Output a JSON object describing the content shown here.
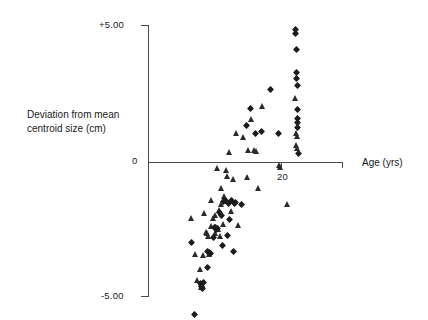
{
  "chart_data": {
    "type": "scatter",
    "title": "",
    "xlabel": "Age (yrs)",
    "ylabel": "Deviation from mean centroid size (cm)",
    "ylabel_line1": "Deviation from mean",
    "ylabel_line2": "centroid size (cm)",
    "grid": false,
    "legend_position": "none",
    "xlim": [
      0,
      29
    ],
    "ylim": [
      -5.6,
      5.3
    ],
    "x_ticks": [
      {
        "value": 20,
        "label": "20"
      },
      {
        "value": 28,
        "label": ""
      }
    ],
    "y_ticks": [
      {
        "value": 5,
        "label": "+5.00"
      },
      {
        "value": 0,
        "label": "0"
      },
      {
        "value": -5,
        "label": "-5.00"
      }
    ],
    "series": [
      {
        "name": "triangle",
        "marker": "triangle",
        "color": "#2b2b2b",
        "points": [
          [
            6.6,
            -2.05
          ],
          [
            7.2,
            -3.35
          ],
          [
            7.4,
            -4.3
          ],
          [
            7.9,
            -3.92
          ],
          [
            8.0,
            -4.45
          ],
          [
            8.05,
            -4.55
          ],
          [
            8.2,
            -4.5
          ],
          [
            8.3,
            -3.4
          ],
          [
            8.5,
            -1.85
          ],
          [
            8.8,
            -2.55
          ],
          [
            9.0,
            -2.6
          ],
          [
            9.1,
            -2.7
          ],
          [
            9.3,
            -3.35
          ],
          [
            9.5,
            -2.35
          ],
          [
            9.55,
            -1.4
          ],
          [
            9.9,
            -2.05
          ],
          [
            10.1,
            -2.6
          ],
          [
            10.2,
            -1.95
          ],
          [
            10.4,
            -0.22
          ],
          [
            10.6,
            -2.45
          ],
          [
            10.7,
            -1.75
          ],
          [
            10.9,
            -2.7
          ],
          [
            11.0,
            -0.95
          ],
          [
            11.1,
            -1.55
          ],
          [
            11.3,
            -2.25
          ],
          [
            11.5,
            -1.25
          ],
          [
            11.8,
            -0.3
          ],
          [
            12.0,
            -0.52
          ],
          [
            12.2,
            0.35
          ],
          [
            12.5,
            -1.8
          ],
          [
            12.9,
            -0.62
          ],
          [
            13.3,
            1.05
          ],
          [
            13.6,
            -2.3
          ],
          [
            14.4,
            0.9
          ],
          [
            15.0,
            -0.55
          ],
          [
            15.2,
            0.45
          ],
          [
            15.6,
            1.55
          ],
          [
            16.0,
            0.42
          ],
          [
            16.3,
            0.4
          ],
          [
            16.6,
            -0.95
          ],
          [
            17.2,
            2.05
          ],
          [
            19.8,
            -0.12
          ],
          [
            20.0,
            -0.2
          ],
          [
            21.0,
            -1.55
          ],
          [
            22.2,
            2.35
          ],
          [
            22.3,
            1.05
          ],
          [
            22.4,
            0.6
          ],
          [
            22.45,
            0.52
          ],
          [
            22.5,
            0.95
          ]
        ]
      },
      {
        "name": "diamond",
        "marker": "diamond",
        "color": "#1c1c1c",
        "points": [
          [
            6.5,
            -2.95
          ],
          [
            7.0,
            -5.55
          ],
          [
            7.9,
            -4.45
          ],
          [
            8.1,
            -4.55
          ],
          [
            8.25,
            -4.6
          ],
          [
            8.4,
            -4.4
          ],
          [
            8.9,
            -3.85
          ],
          [
            9.0,
            -3.25
          ],
          [
            9.2,
            -3.3
          ],
          [
            9.4,
            -3.35
          ],
          [
            9.8,
            -2.75
          ],
          [
            10.0,
            -2.4
          ],
          [
            10.2,
            -2.38
          ],
          [
            10.3,
            -2.45
          ],
          [
            10.5,
            -2.42
          ],
          [
            10.8,
            -1.85
          ],
          [
            11.0,
            -1.95
          ],
          [
            11.2,
            -3.05
          ],
          [
            11.4,
            -1.45
          ],
          [
            11.6,
            -1.4
          ],
          [
            11.9,
            -2.7
          ],
          [
            12.1,
            -1.5
          ],
          [
            12.3,
            -2.1
          ],
          [
            12.6,
            -1.42
          ],
          [
            12.8,
            -3.25
          ],
          [
            13.0,
            -1.5
          ],
          [
            13.1,
            -1.48
          ],
          [
            14.0,
            -1.55
          ],
          [
            14.8,
            1.35
          ],
          [
            15.4,
            1.95
          ],
          [
            16.2,
            1.05
          ],
          [
            17.0,
            1.1
          ],
          [
            18.4,
            2.65
          ],
          [
            19.6,
            1.05
          ],
          [
            22.2,
            4.85
          ],
          [
            22.25,
            4.7
          ],
          [
            22.3,
            4.1
          ],
          [
            22.35,
            3.25
          ],
          [
            22.4,
            3.05
          ],
          [
            22.42,
            2.8
          ],
          [
            22.45,
            1.9
          ],
          [
            22.5,
            1.6
          ],
          [
            22.52,
            1.45
          ],
          [
            22.55,
            1.25
          ],
          [
            22.6,
            0.3
          ]
        ]
      }
    ]
  }
}
